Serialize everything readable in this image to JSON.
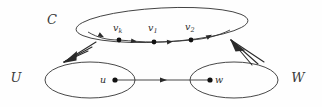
{
  "figure": {
    "caption": "",
    "background_color": "#fefefe",
    "stroke_color": "#333333",
    "width": 322,
    "height": 107
  },
  "regions": [
    {
      "id": "C",
      "label": "C",
      "label_x": 52,
      "label_y": 24,
      "cx": 162,
      "cy": 25,
      "rx": 86,
      "ry": 17,
      "rotation": -3
    },
    {
      "id": "U",
      "label": "U",
      "label_x": 16,
      "label_y": 82,
      "cx": 90,
      "cy": 80,
      "rx": 45,
      "ry": 18,
      "rotation": 0
    },
    {
      "id": "W",
      "label": "W",
      "label_x": 298,
      "label_y": 82,
      "cx": 234,
      "cy": 80,
      "rx": 44,
      "ry": 18,
      "rotation": 0
    }
  ],
  "vertices": [
    {
      "id": "vk",
      "base": "v",
      "sub": "k",
      "x": 119,
      "y": 40,
      "label_x": 113,
      "label_y": 29,
      "r": 2.4
    },
    {
      "id": "v1",
      "base": "v",
      "sub": "1",
      "x": 154,
      "y": 42,
      "label_x": 148,
      "label_y": 29,
      "r": 2.4
    },
    {
      "id": "v2",
      "base": "v",
      "sub": "2",
      "x": 191,
      "y": 40,
      "label_x": 185,
      "label_y": 28,
      "r": 2.4
    },
    {
      "id": "u",
      "base": "u",
      "sub": "",
      "x": 115,
      "y": 80,
      "label_x": 103,
      "label_y": 83,
      "r": 2.6
    },
    {
      "id": "w",
      "base": "w",
      "sub": "",
      "x": 210,
      "y": 80,
      "label_x": 216,
      "label_y": 83,
      "r": 2.6
    }
  ],
  "cycle_path": {
    "id": "cycle-directed-path",
    "description": "directed path along bottom of C",
    "d": "M 88 32 C 98 38, 108 40, 119 40 C 132 41, 142 42, 154 42 C 168 42, 180 41, 191 40 C 205 39, 218 36, 230 30",
    "arrow_points": [
      {
        "x": 104,
        "y": 37.2,
        "angle": 28
      },
      {
        "x": 137,
        "y": 41.6,
        "angle": 8
      },
      {
        "x": 173,
        "y": 41.6,
        "angle": -5
      },
      {
        "x": 212,
        "y": 34.8,
        "angle": -28
      }
    ]
  },
  "edges": [
    {
      "id": "u-to-w",
      "from": "u",
      "to": "w",
      "d": "M 117 80 L 208 80",
      "arrow": {
        "x": 167,
        "y": 80,
        "angle": 0
      }
    }
  ],
  "relations": [
    {
      "id": "c-to-u",
      "description": "multi-stroke arrow from cycle C down-left to set U",
      "tip_x": 64,
      "tip_y": 62,
      "strokes": [
        {
          "x1": 64,
          "y1": 62,
          "x2": 96,
          "y2": 42
        },
        {
          "x1": 64,
          "y1": 62,
          "x2": 92,
          "y2": 47
        },
        {
          "x1": 64,
          "y1": 62,
          "x2": 88,
          "y2": 51
        }
      ],
      "head": "M 64 62 L 76 51 L 75 59 Z"
    },
    {
      "id": "w-to-c",
      "description": "multi-stroke arrow from set W up-left to cycle C",
      "tip_x": 231,
      "tip_y": 40,
      "strokes": [
        {
          "x1": 231,
          "y1": 40,
          "x2": 264,
          "y2": 62
        },
        {
          "x1": 231,
          "y1": 40,
          "x2": 258,
          "y2": 64
        },
        {
          "x1": 231,
          "y1": 40,
          "x2": 252,
          "y2": 65
        }
      ],
      "head": "M 231 40 L 244 50 L 236 51 Z"
    }
  ]
}
